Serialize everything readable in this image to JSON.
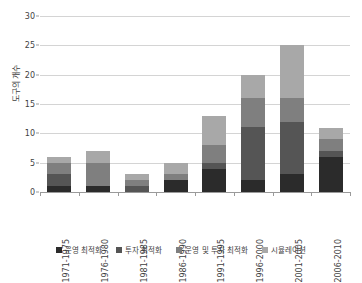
{
  "chart_data": {
    "type": "bar",
    "stacked": true,
    "title": "",
    "xlabel": "",
    "ylabel": "도구의 개수",
    "ylim": [
      0,
      30
    ],
    "yticks": [
      0,
      5,
      10,
      15,
      20,
      25,
      30
    ],
    "grid": true,
    "legend_position": "bottom",
    "categories": [
      "1971-1975",
      "1976-1980",
      "1981-1985",
      "1986-1990",
      "1991-1995",
      "1996-2000",
      "2001-2005",
      "2006-2010"
    ],
    "series": [
      {
        "name": "운영 최적화",
        "color": "#2b2b2b",
        "values": [
          1,
          1,
          0,
          2,
          4,
          2,
          3,
          6
        ]
      },
      {
        "name": "투자 최적화",
        "color": "#555555",
        "values": [
          2,
          0,
          1,
          0,
          1,
          9,
          9,
          1
        ]
      },
      {
        "name": "운영 및 투자 최적화",
        "color": "#7f7f7f",
        "values": [
          2,
          4,
          1,
          1,
          3,
          5,
          4,
          2
        ]
      },
      {
        "name": "시뮬레이션",
        "color": "#a8a8a8",
        "values": [
          1,
          2,
          1,
          2,
          5,
          4,
          9,
          2
        ]
      }
    ],
    "totals": [
      6,
      7,
      3,
      5,
      13,
      20,
      25,
      11
    ]
  },
  "axes": {
    "y_tick_labels": [
      "0",
      "5",
      "10",
      "15",
      "20",
      "25",
      "30"
    ],
    "y_axis_title": "도구의 개수"
  },
  "legend": {
    "items": [
      {
        "label": "운영 최적화",
        "color": "#2b2b2b"
      },
      {
        "label": "투자 최적화",
        "color": "#555555"
      },
      {
        "label": "운영 및 투자 최적화",
        "color": "#7f7f7f"
      },
      {
        "label": "시뮬레이션",
        "color": "#a8a8a8"
      }
    ]
  },
  "style": {
    "gridline_color": "#d4d4d4",
    "axis_color": "#9a9a9a",
    "text_color": "#3f3f3f",
    "background": "#ffffff"
  }
}
